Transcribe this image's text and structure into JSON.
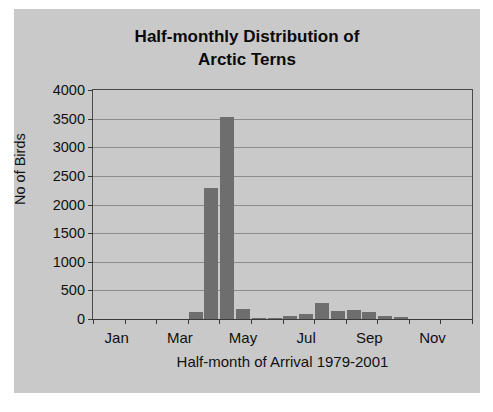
{
  "chart_data": {
    "type": "bar",
    "title": "Half-monthly Distribution of Arctic Terns",
    "title_line1": "Half-monthly Distribution of",
    "title_line2": "Arctic Terns",
    "xlabel": "Half-month of Arrival 1979-2001",
    "ylabel": "No of Birds",
    "ylim": [
      0,
      4000
    ],
    "ytick_labels": [
      "4000",
      "3500",
      "3000",
      "2500",
      "2000",
      "1500",
      "1000",
      "500",
      "0"
    ],
    "ytick_values": [
      4000,
      3500,
      3000,
      2500,
      2000,
      1500,
      1000,
      500,
      0
    ],
    "xtick_labels": [
      "Jan",
      "Mar",
      "May",
      "Jul",
      "Sep",
      "Nov"
    ],
    "xtick_positions": [
      1,
      5,
      9,
      13,
      17,
      21
    ],
    "grid": "horizontal",
    "legend": "none",
    "bar_color": "#6e6e6e",
    "background_color": "#c9c9c9",
    "text_color": "#111111",
    "categories": [
      "Jan-1",
      "Jan-2",
      "Feb-1",
      "Feb-2",
      "Mar-1",
      "Mar-2",
      "Apr-1",
      "Apr-2",
      "May-1",
      "May-2",
      "Jun-1",
      "Jun-2",
      "Jul-1",
      "Jul-2",
      "Aug-1",
      "Aug-2",
      "Sep-1",
      "Sep-2",
      "Oct-1",
      "Oct-2",
      "Nov-1",
      "Nov-2",
      "Dec-1",
      "Dec-2"
    ],
    "values": [
      0,
      0,
      0,
      0,
      0,
      0,
      130,
      2290,
      3530,
      180,
      20,
      15,
      60,
      90,
      280,
      140,
      150,
      130,
      50,
      40,
      0,
      0,
      0,
      0
    ]
  }
}
